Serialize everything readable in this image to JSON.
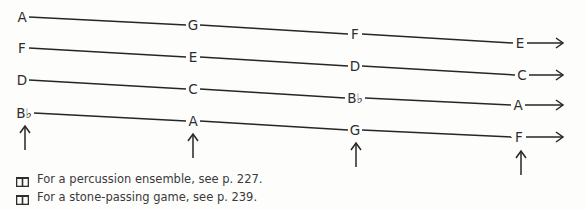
{
  "diagram": {
    "rows": [
      {
        "notes": [
          {
            "name": "A",
            "x": 22,
            "y": 17
          },
          {
            "name": "G",
            "x": 193,
            "y": 25
          },
          {
            "name": "F",
            "x": 355,
            "y": 34
          },
          {
            "name": "E",
            "x": 520,
            "y": 43
          }
        ]
      },
      {
        "notes": [
          {
            "name": "F",
            "x": 22,
            "y": 48
          },
          {
            "name": "E",
            "x": 193,
            "y": 57
          },
          {
            "name": "D",
            "x": 355,
            "y": 66
          },
          {
            "name": "C",
            "x": 522,
            "y": 75
          }
        ]
      },
      {
        "notes": [
          {
            "name": "D",
            "x": 22,
            "y": 80
          },
          {
            "name": "C",
            "x": 193,
            "y": 89
          },
          {
            "name": "B♭",
            "x": 355,
            "y": 98
          },
          {
            "name": "A",
            "x": 518,
            "y": 105
          }
        ]
      },
      {
        "notes": [
          {
            "name": "B♭",
            "x": 24,
            "y": 113
          },
          {
            "name": "A",
            "x": 193,
            "y": 121
          },
          {
            "name": "G",
            "x": 355,
            "y": 130
          },
          {
            "name": "F",
            "x": 519,
            "y": 137
          }
        ]
      }
    ],
    "up_arrows": [
      {
        "x": 25,
        "y1": 150,
        "y2": 126
      },
      {
        "x": 193,
        "y1": 158,
        "y2": 134
      },
      {
        "x": 356,
        "y1": 167,
        "y2": 143
      },
      {
        "x": 521,
        "y1": 175,
        "y2": 151
      }
    ],
    "arrow_end_x": 563
  },
  "footnotes": [
    {
      "icon": "book-icon",
      "text": "For a percussion ensemble, see p. 227."
    },
    {
      "icon": "book-icon",
      "text": "For a stone-passing game, see p. 239."
    }
  ]
}
